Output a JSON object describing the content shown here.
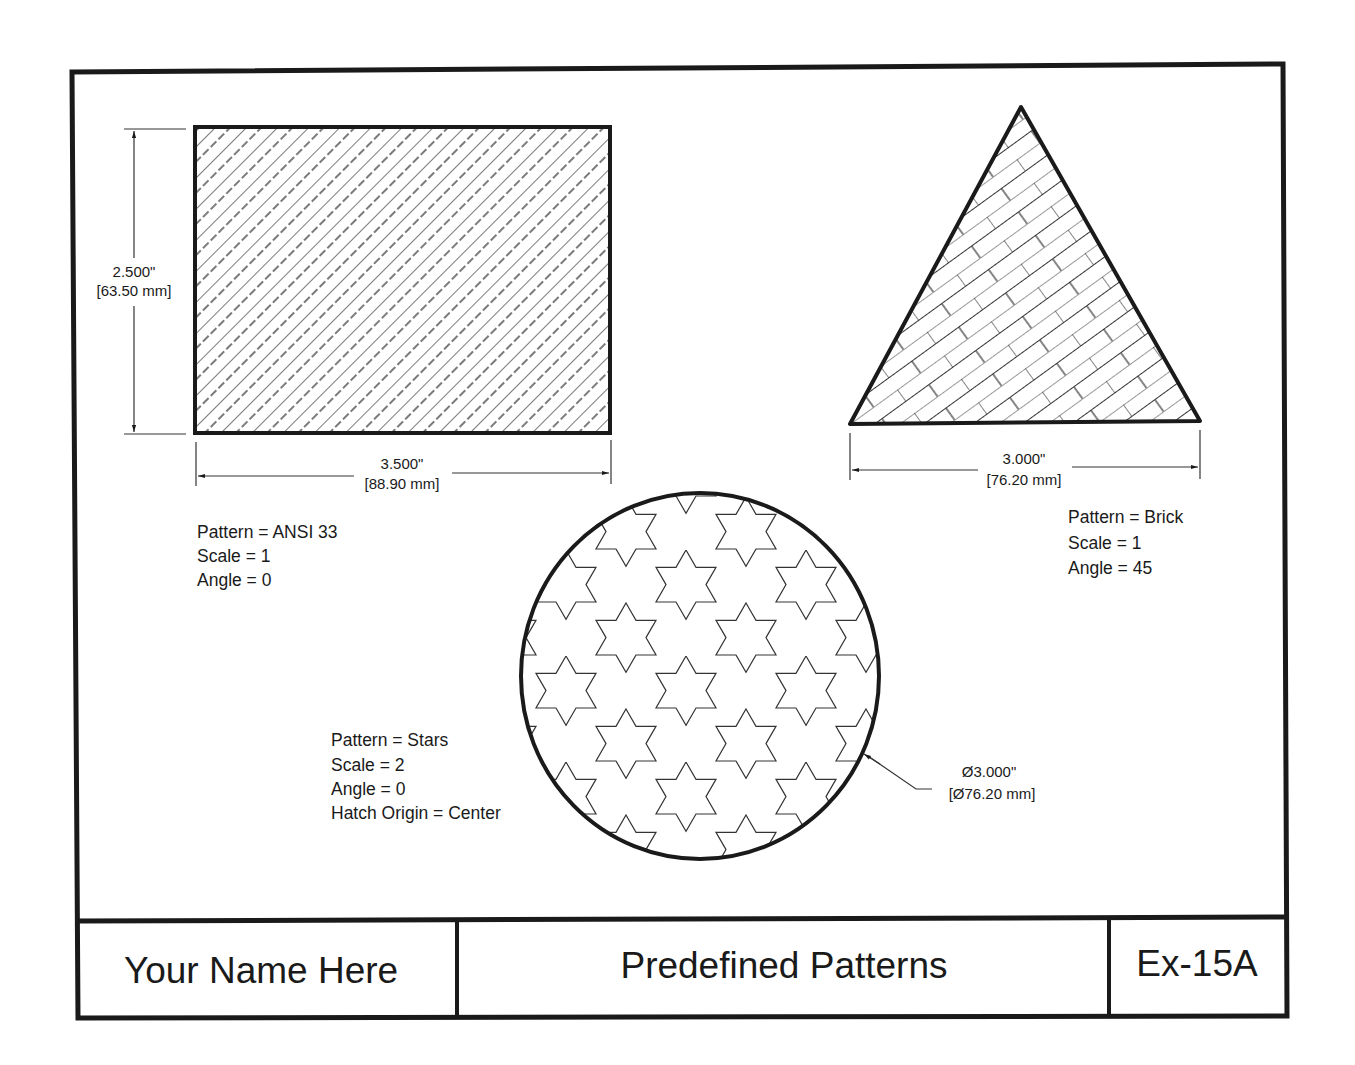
{
  "title_block": {
    "author": "Your Name Here",
    "title": "Predefined Patterns",
    "exercise": "Ex-15A"
  },
  "rectangle": {
    "height_dim": {
      "inch": "2.500\"",
      "mm": "[63.50 mm]"
    },
    "width_dim": {
      "inch": "3.500\"",
      "mm": "[88.90 mm]"
    },
    "notes": [
      "Pattern = ANSI 33",
      "Scale = 1",
      "Angle = 0"
    ]
  },
  "triangle": {
    "width_dim": {
      "inch": "3.000\"",
      "mm": "[76.20 mm]"
    },
    "notes": [
      "Pattern = Brick",
      "Scale = 1",
      "Angle = 45"
    ]
  },
  "circle": {
    "diameter_dim": {
      "inch": "Ø3.000\"",
      "mm": "[Ø76.20 mm]"
    },
    "notes": [
      "Pattern = Stars",
      "Scale = 2",
      "Angle = 0",
      "Hatch Origin = Center"
    ]
  },
  "colors": {
    "ink": "#1a1a1a",
    "hatch": "#333333",
    "paper": "#ffffff"
  }
}
